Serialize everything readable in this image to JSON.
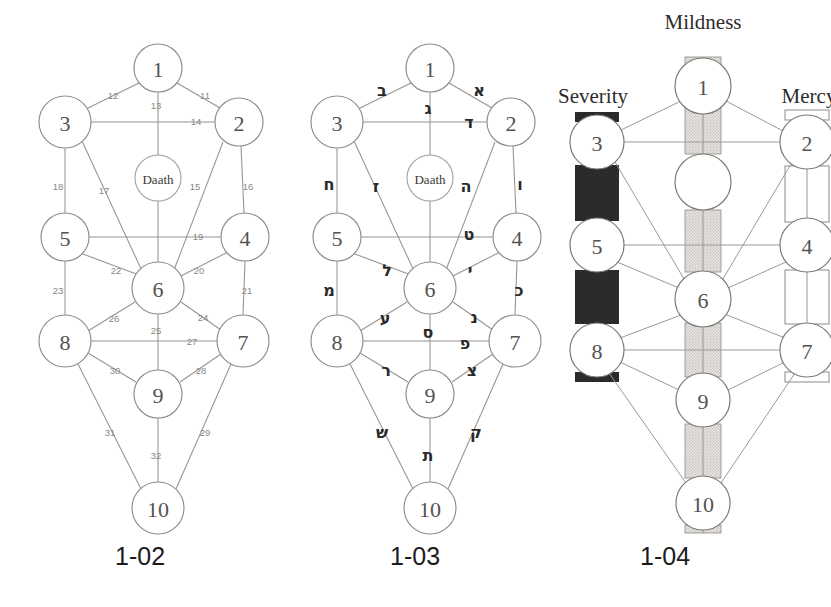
{
  "figure": {
    "background_color": "#ffffff"
  },
  "captions": {
    "fig1": "1-02",
    "fig2": "1-03",
    "fig3": "1-04"
  },
  "sephiroth_labels": [
    "1",
    "2",
    "3",
    "4",
    "5",
    "6",
    "7",
    "8",
    "9",
    "10"
  ],
  "daath_label": "Daath",
  "nodes": [
    {
      "id": "1",
      "label": "1",
      "cx": 158,
      "cy": 68,
      "r": 24
    },
    {
      "id": "2",
      "label": "2",
      "cx": 239,
      "cy": 122,
      "r": 24
    },
    {
      "id": "3",
      "label": "3",
      "cx": 65,
      "cy": 122,
      "r": 26
    },
    {
      "id": "4",
      "label": "4",
      "cx": 245,
      "cy": 237,
      "r": 24
    },
    {
      "id": "5",
      "label": "5",
      "cx": 65,
      "cy": 237,
      "r": 24
    },
    {
      "id": "6",
      "label": "6",
      "cx": 158,
      "cy": 288,
      "r": 26
    },
    {
      "id": "7",
      "label": "7",
      "cx": 243,
      "cy": 341,
      "r": 26
    },
    {
      "id": "8",
      "label": "8",
      "cx": 65,
      "cy": 341,
      "r": 26
    },
    {
      "id": "9",
      "label": "9",
      "cx": 158,
      "cy": 394,
      "r": 24
    },
    {
      "id": "10",
      "label": "10",
      "cx": 158,
      "cy": 508,
      "r": 26
    }
  ],
  "daath": {
    "cx": 158,
    "cy": 178,
    "r": 23
  },
  "paths": [
    {
      "num": "11",
      "from": "1",
      "to": "2",
      "label_x": 205,
      "label_y": 95,
      "hebrew": "א",
      "heb_x": 207,
      "heb_y": 90
    },
    {
      "num": "12",
      "from": "1",
      "to": "3",
      "label_x": 113,
      "label_y": 95,
      "hebrew": "ב",
      "heb_x": 110,
      "heb_y": 90
    },
    {
      "num": "13",
      "from": "1",
      "to": "6",
      "label_x": 156,
      "label_y": 105,
      "hebrew": "ג",
      "heb_x": 156,
      "heb_y": 108
    },
    {
      "num": "14",
      "from": "3",
      "to": "2",
      "label_x": 196,
      "label_y": 121,
      "hebrew": "ד",
      "heb_x": 197,
      "heb_y": 122
    },
    {
      "num": "15",
      "from": "2",
      "to": "6",
      "label_x": 195,
      "label_y": 186,
      "hebrew": "ה",
      "heb_x": 194,
      "heb_y": 186
    },
    {
      "num": "16",
      "from": "2",
      "to": "4",
      "label_x": 248,
      "label_y": 186,
      "hebrew": "ו",
      "heb_x": 248,
      "heb_y": 184
    },
    {
      "num": "17",
      "from": "3",
      "to": "6",
      "label_x": 104,
      "label_y": 190,
      "hebrew": "ז",
      "heb_x": 104,
      "heb_y": 186
    },
    {
      "num": "18",
      "from": "3",
      "to": "5",
      "label_x": 58,
      "label_y": 186,
      "hebrew": "ח",
      "heb_x": 57,
      "heb_y": 184
    },
    {
      "num": "19",
      "from": "5",
      "to": "4",
      "label_x": 198,
      "label_y": 236,
      "hebrew": "ט",
      "heb_x": 197,
      "heb_y": 234
    },
    {
      "num": "20",
      "from": "4",
      "to": "6",
      "label_x": 199,
      "label_y": 270,
      "hebrew": "י",
      "heb_x": 198,
      "heb_y": 270
    },
    {
      "num": "21",
      "from": "4",
      "to": "7",
      "label_x": 247,
      "label_y": 290,
      "hebrew": "כ",
      "heb_x": 247,
      "heb_y": 290
    },
    {
      "num": "22",
      "from": "5",
      "to": "6",
      "label_x": 116,
      "label_y": 270,
      "hebrew": "ל",
      "heb_x": 115,
      "heb_y": 270
    },
    {
      "num": "23",
      "from": "5",
      "to": "8",
      "label_x": 58,
      "label_y": 290,
      "hebrew": "מ",
      "heb_x": 57,
      "heb_y": 290
    },
    {
      "num": "24",
      "from": "6",
      "to": "7",
      "label_x": 203,
      "label_y": 317,
      "hebrew": "נ",
      "heb_x": 202,
      "heb_y": 317
    },
    {
      "num": "25",
      "from": "6",
      "to": "9",
      "label_x": 156,
      "label_y": 330,
      "hebrew": "ס",
      "heb_x": 156,
      "heb_y": 332
    },
    {
      "num": "26",
      "from": "6",
      "to": "8",
      "label_x": 114,
      "label_y": 318,
      "hebrew": "ע",
      "heb_x": 113,
      "heb_y": 318
    },
    {
      "num": "27",
      "from": "8",
      "to": "7",
      "label_x": 192,
      "label_y": 341,
      "hebrew": "פ",
      "heb_x": 193,
      "heb_y": 343
    },
    {
      "num": "28",
      "from": "7",
      "to": "9",
      "label_x": 201,
      "label_y": 370,
      "hebrew": "צ",
      "heb_x": 200,
      "heb_y": 370
    },
    {
      "num": "29",
      "from": "7",
      "to": "10",
      "label_x": 205,
      "label_y": 432,
      "hebrew": "ק",
      "heb_x": 204,
      "heb_y": 432
    },
    {
      "num": "30",
      "from": "8",
      "to": "9",
      "label_x": 115,
      "label_y": 370,
      "hebrew": "ר",
      "heb_x": 114,
      "heb_y": 370
    },
    {
      "num": "31",
      "from": "8",
      "to": "10",
      "label_x": 110,
      "label_y": 432,
      "hebrew": "ש",
      "heb_x": 110,
      "heb_y": 432
    },
    {
      "num": "32",
      "from": "9",
      "to": "10",
      "label_x": 156,
      "label_y": 455,
      "hebrew": "ת",
      "heb_x": 156,
      "heb_y": 455
    }
  ],
  "hebrew_letter_names": [
    "Aleph",
    "Beth",
    "Gimel",
    "Daleth",
    "He",
    "Vau",
    "Zayin",
    "Cheth",
    "Teth",
    "Yod",
    "Kaph",
    "Lamed",
    "Mem",
    "Nun",
    "Samekh",
    "Ayin",
    "Pe",
    "Tzaddi",
    "Qoph",
    "Resh",
    "Shin",
    "Tau"
  ],
  "pillars": {
    "left": {
      "name": "Severity",
      "label_x": 48,
      "label_y": 50,
      "color": "#2a2a2a",
      "style": "solid-dark"
    },
    "middle": {
      "name": "Mildness",
      "label_x": 158,
      "label_y": 20,
      "color": "#b9b6b1",
      "style": "stippled"
    },
    "right": {
      "name": "Mercy",
      "label_x": 262,
      "label_y": 50,
      "color": "#ffffff",
      "style": "outline"
    }
  },
  "fig3_nodes": [
    {
      "id": "1",
      "label": "1",
      "cx": 158,
      "cy": 86,
      "r": 28
    },
    {
      "id": "2",
      "label": "2",
      "cx": 262,
      "cy": 142,
      "r": 27
    },
    {
      "id": "3",
      "label": "3",
      "cx": 52,
      "cy": 142,
      "r": 27
    },
    {
      "id": "unnumbered",
      "label": "",
      "cx": 158,
      "cy": 182,
      "r": 28
    },
    {
      "id": "4",
      "label": "4",
      "cx": 262,
      "cy": 245,
      "r": 27
    },
    {
      "id": "5",
      "label": "5",
      "cx": 52,
      "cy": 245,
      "r": 27
    },
    {
      "id": "6",
      "label": "6",
      "cx": 158,
      "cy": 299,
      "r": 28
    },
    {
      "id": "7",
      "label": "7",
      "cx": 262,
      "cy": 350,
      "r": 27
    },
    {
      "id": "8",
      "label": "8",
      "cx": 52,
      "cy": 350,
      "r": 27
    },
    {
      "id": "9",
      "label": "9",
      "cx": 158,
      "cy": 400,
      "r": 27
    },
    {
      "id": "10",
      "label": "10",
      "cx": 158,
      "cy": 503,
      "r": 27
    }
  ]
}
